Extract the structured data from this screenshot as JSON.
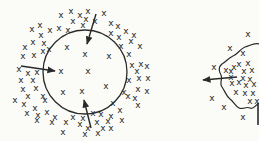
{
  "figure": {
    "ink_color": "#2a2a2a",
    "background": "#fbfbf8",
    "marker_glyph": "x",
    "left_panel": {
      "boundary": {
        "shape": "circle",
        "cx": 85,
        "cy": 72,
        "r": 42
      },
      "inside_markers": [
        [
          67,
          47
        ],
        [
          85,
          54
        ],
        [
          109,
          56
        ],
        [
          61,
          71
        ],
        [
          88,
          71
        ],
        [
          106,
          86
        ],
        [
          63,
          92
        ],
        [
          82,
          91
        ]
      ],
      "outside_markers": [
        [
          61,
          15
        ],
        [
          71,
          11
        ],
        [
          80,
          15
        ],
        [
          88,
          11
        ],
        [
          104,
          13
        ],
        [
          73,
          21
        ],
        [
          83,
          25
        ],
        [
          95,
          21
        ],
        [
          86,
          19
        ],
        [
          40,
          25
        ],
        [
          32,
          29
        ],
        [
          50,
          30
        ],
        [
          41,
          35
        ],
        [
          59,
          28
        ],
        [
          68,
          30
        ],
        [
          111,
          23
        ],
        [
          118,
          26
        ],
        [
          126,
          31
        ],
        [
          134,
          35
        ],
        [
          33,
          42
        ],
        [
          44,
          43
        ],
        [
          25,
          47
        ],
        [
          49,
          49
        ],
        [
          34,
          55
        ],
        [
          23,
          56
        ],
        [
          43,
          51
        ],
        [
          111,
          33
        ],
        [
          119,
          37
        ],
        [
          131,
          41
        ],
        [
          140,
          46
        ],
        [
          121,
          46
        ],
        [
          129,
          54
        ],
        [
          132,
          65
        ],
        [
          141,
          64
        ],
        [
          147,
          66
        ],
        [
          137,
          71
        ],
        [
          19,
          69
        ],
        [
          28,
          73
        ],
        [
          37,
          72
        ],
        [
          21,
          80
        ],
        [
          33,
          80
        ],
        [
          139,
          78
        ],
        [
          148,
          78
        ],
        [
          129,
          80
        ],
        [
          147,
          91
        ],
        [
          138,
          89
        ],
        [
          23,
          89
        ],
        [
          36,
          88
        ],
        [
          28,
          96
        ],
        [
          43,
          96
        ],
        [
          15,
          100
        ],
        [
          24,
          104
        ],
        [
          35,
          108
        ],
        [
          45,
          100
        ],
        [
          124,
          92
        ],
        [
          135,
          98
        ],
        [
          138,
          105
        ],
        [
          128,
          96
        ],
        [
          27,
          113
        ],
        [
          38,
          115
        ],
        [
          47,
          112
        ],
        [
          55,
          117
        ],
        [
          37,
          120
        ],
        [
          52,
          122
        ],
        [
          66,
          122
        ],
        [
          73,
          117
        ],
        [
          83,
          118
        ],
        [
          93,
          113
        ],
        [
          101,
          114
        ],
        [
          111,
          116
        ],
        [
          120,
          110
        ],
        [
          113,
          103
        ],
        [
          80,
          124
        ],
        [
          88,
          128
        ],
        [
          97,
          122
        ],
        [
          108,
          121
        ],
        [
          103,
          128
        ],
        [
          63,
          132
        ],
        [
          85,
          134
        ],
        [
          98,
          133
        ],
        [
          111,
          128
        ],
        [
          122,
          120
        ]
      ],
      "arrows": [
        {
          "label": "arrow-top-inward",
          "x1": 96,
          "y1": 14,
          "x2": 87,
          "y2": 44
        },
        {
          "label": "arrow-left-inward",
          "x1": 21,
          "y1": 66,
          "x2": 55,
          "y2": 71
        },
        {
          "label": "arrow-bottom-inward",
          "x1": 91,
          "y1": 128,
          "x2": 84,
          "y2": 100
        }
      ]
    },
    "right_panel": {
      "boundary": {
        "shape": "irregular-blob",
        "clipped_at_right_edge": true
      },
      "inside_markers": [
        [
          243,
          53
        ],
        [
          248,
          63
        ],
        [
          239,
          64
        ],
        [
          234,
          67
        ],
        [
          226,
          70
        ],
        [
          231,
          71
        ],
        [
          244,
          71
        ],
        [
          252,
          70
        ],
        [
          231,
          77
        ],
        [
          243,
          78
        ],
        [
          250,
          79
        ],
        [
          232,
          83
        ],
        [
          239,
          82
        ],
        [
          246,
          85
        ],
        [
          254,
          84
        ],
        [
          236,
          92
        ],
        [
          245,
          93
        ],
        [
          253,
          93
        ],
        [
          250,
          101
        ],
        [
          257,
          101
        ]
      ],
      "outside_markers": [
        [
          248,
          34
        ],
        [
          230,
          48
        ],
        [
          214,
          67
        ],
        [
          212,
          98
        ],
        [
          224,
          107
        ],
        [
          243,
          117
        ]
      ],
      "arrows": [
        {
          "label": "arrow-left-outward",
          "x1": 237,
          "y1": 77,
          "x2": 203,
          "y2": 80
        }
      ],
      "vertical_line": {
        "x": 258,
        "y1": 103,
        "y2": 125
      }
    }
  }
}
